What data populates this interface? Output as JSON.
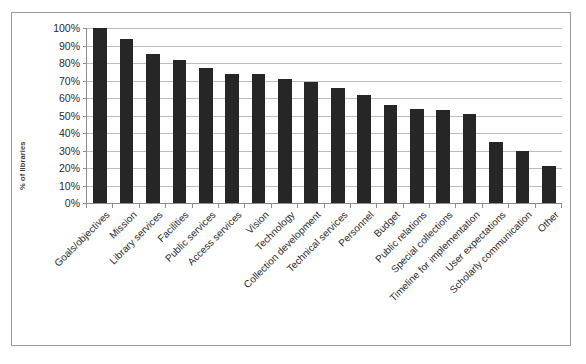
{
  "chart_data": {
    "type": "bar",
    "title": "",
    "subtitle": "",
    "xlabel": "",
    "ylabel": "% of libraries",
    "ylim": [
      0,
      100
    ],
    "grid": true,
    "legend": null,
    "y_ticks": [
      "0%",
      "10%",
      "20%",
      "30%",
      "40%",
      "50%",
      "60%",
      "70%",
      "80%",
      "90%",
      "100%"
    ],
    "y_tick_values": [
      0,
      10,
      20,
      30,
      40,
      50,
      60,
      70,
      80,
      90,
      100
    ],
    "categories": [
      "Goals/objectives",
      "Mission",
      "Library services",
      "Facilities",
      "Public services",
      "Access services",
      "Vision",
      "Technology",
      "Collection development",
      "Technical services",
      "Personnel",
      "Budget",
      "Public relations",
      "Special collections",
      "Timeline for implementation",
      "User expectations",
      "Scholarly communication",
      "Other"
    ],
    "values": [
      100,
      94,
      85,
      82,
      77,
      74,
      74,
      71,
      69,
      66,
      62,
      56,
      54,
      53,
      51,
      35,
      30,
      21
    ],
    "bar_color": "#262626",
    "gridline_color": "#bcbcbc",
    "axis_color": "#8c8c8c",
    "frame_color": "#9a9a9a",
    "background_color": "#ffffff"
  }
}
